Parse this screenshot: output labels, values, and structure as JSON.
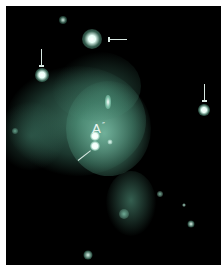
{
  "image": {
    "description": "Astronomical false-color image: diffuse teal nebular emission with bright point sources, several marked with arrows",
    "colors": {
      "background": "#000000",
      "frame": "#ffffff",
      "nebula": "#4f9a82",
      "source": "#f4fffb",
      "arrow": "#d8e8e2"
    },
    "labels": [
      {
        "text": "A",
        "x": 92,
        "y": 118
      }
    ],
    "annotation_tick": "″"
  }
}
